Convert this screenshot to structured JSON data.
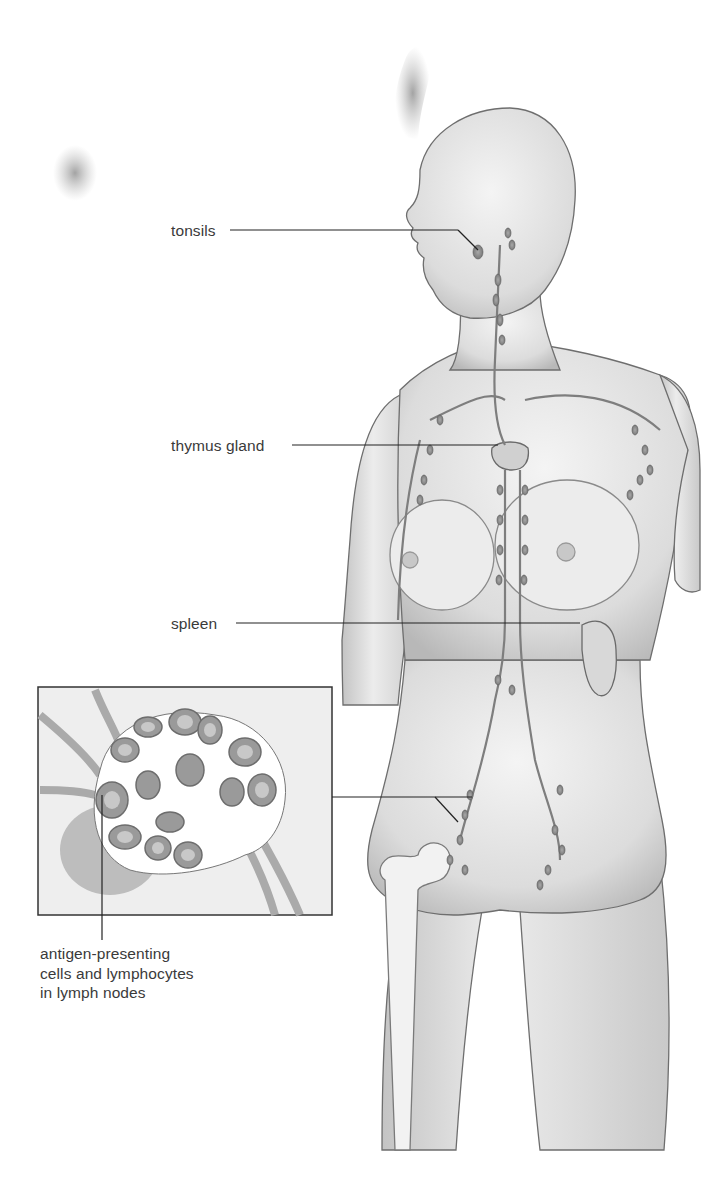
{
  "diagram": {
    "title": "",
    "labels": {
      "tonsils": "tonsils",
      "thymus": "thymus gland",
      "spleen": "spleen",
      "lymph_nodes": [
        "antigen-presenting",
        "cells and lymphocytes",
        "in lymph nodes"
      ]
    },
    "inset": {
      "subject": "lymph node cross-section",
      "frame": {
        "x": 38,
        "y": 687,
        "width": 294,
        "height": 228
      }
    },
    "colors": {
      "background": "#ffffff",
      "skin": "#e6e6e6",
      "skin_shadow": "#bdbdbd",
      "outline": "#6e6e6e",
      "node": "#8a8a8a",
      "leader_line": "#222222",
      "label_text": "#3a3a3a",
      "inset_bg": "#eeeeee"
    }
  }
}
